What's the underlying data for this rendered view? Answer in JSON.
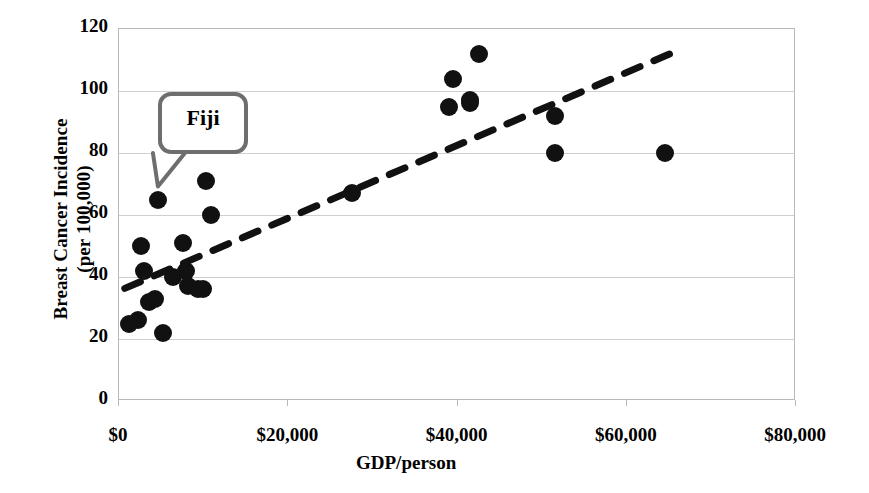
{
  "chart_data": {
    "type": "scatter",
    "title": "",
    "xlabel": "GDP/person",
    "ylabel": "Breast Cancer Incidence (per 100,000)",
    "ylabel_lines": [
      "Breast Cancer Incidence",
      "(per 100,000)"
    ],
    "xlim": [
      0,
      80000
    ],
    "ylim": [
      0,
      120
    ],
    "xticks": [
      0,
      20000,
      40000,
      60000,
      80000
    ],
    "xticklabels": [
      "$0",
      "$20,000",
      "$40,000",
      "$60,000",
      "$80,000"
    ],
    "yticks": [
      0,
      20,
      40,
      60,
      80,
      100,
      120
    ],
    "yticklabels": [
      "0",
      "20",
      "40",
      "60",
      "80",
      "100",
      "120"
    ],
    "grid": "horizontal",
    "legend": "none",
    "marker": {
      "shape": "circle",
      "color": "#111111",
      "size": 18
    },
    "points": [
      {
        "x": 1200,
        "y": 25
      },
      {
        "x": 2200,
        "y": 26
      },
      {
        "x": 2600,
        "y": 50
      },
      {
        "x": 2900,
        "y": 42
      },
      {
        "x": 3500,
        "y": 32
      },
      {
        "x": 4200,
        "y": 33
      },
      {
        "x": 4600,
        "y": 65
      },
      {
        "x": 5200,
        "y": 22
      },
      {
        "x": 6400,
        "y": 40
      },
      {
        "x": 7600,
        "y": 51
      },
      {
        "x": 7900,
        "y": 42
      },
      {
        "x": 8200,
        "y": 37
      },
      {
        "x": 9300,
        "y": 36
      },
      {
        "x": 9900,
        "y": 36
      },
      {
        "x": 10300,
        "y": 71
      },
      {
        "x": 10900,
        "y": 60
      },
      {
        "x": 27500,
        "y": 67
      },
      {
        "x": 39500,
        "y": 104
      },
      {
        "x": 39000,
        "y": 95
      },
      {
        "x": 41500,
        "y": 97
      },
      {
        "x": 41500,
        "y": 96
      },
      {
        "x": 42500,
        "y": 112
      },
      {
        "x": 51500,
        "y": 92
      },
      {
        "x": 51500,
        "y": 80
      },
      {
        "x": 64500,
        "y": 80
      }
    ],
    "trendline": {
      "style": "dashed",
      "color": "#111111",
      "x_start": 800,
      "y_start": 36,
      "x_end": 65500,
      "y_end": 112
    },
    "annotations": [
      {
        "label": "Fiji",
        "type": "callout-bubble",
        "points_to": {
          "x": 4600,
          "y": 65
        }
      }
    ]
  },
  "axis": {
    "y_title_line1": "Breast Cancer Incidence",
    "y_title_line2": "(per 100,000)",
    "x_title": "GDP/person",
    "y_labels": [
      "120",
      "100",
      "80",
      "60",
      "40",
      "20",
      "0"
    ],
    "x_labels": [
      "$0",
      "$20,000",
      "$40,000",
      "$60,000",
      "$80,000"
    ]
  },
  "annotation": {
    "fiji_label": "Fiji"
  },
  "colors": {
    "marker": "#111111",
    "trendline": "#111111",
    "gridline": "#cfcfcf",
    "frame": "#b9b9b9",
    "callout_border": "#6e6e6e"
  }
}
